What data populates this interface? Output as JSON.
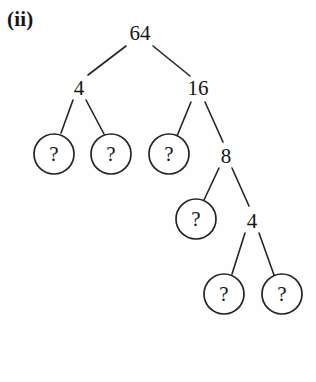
{
  "figure": {
    "label": "(ii)",
    "type": "factor-tree",
    "background_color": "#fefefe",
    "ink_color": "#242424",
    "text_color": "#161616"
  },
  "nodes": [
    {
      "id": "n-64",
      "label": "64",
      "kind": "value",
      "x": 140,
      "y": 33,
      "level": 0
    },
    {
      "id": "n-4a",
      "label": "4",
      "kind": "value",
      "x": 79,
      "y": 88,
      "level": 1
    },
    {
      "id": "n-16",
      "label": "16",
      "kind": "value",
      "x": 198,
      "y": 88,
      "level": 1
    },
    {
      "id": "q-1",
      "label": "?",
      "kind": "unknown",
      "x": 54,
      "y": 154,
      "r": 20,
      "level": 2
    },
    {
      "id": "q-2",
      "label": "?",
      "kind": "unknown",
      "x": 111,
      "y": 154,
      "r": 20,
      "level": 2
    },
    {
      "id": "q-3",
      "label": "?",
      "kind": "unknown",
      "x": 169,
      "y": 154,
      "r": 20,
      "level": 2
    },
    {
      "id": "n-8",
      "label": "8",
      "kind": "value",
      "x": 226,
      "y": 156,
      "level": 2
    },
    {
      "id": "q-4",
      "label": "?",
      "kind": "unknown",
      "x": 196,
      "y": 219,
      "r": 20,
      "level": 3
    },
    {
      "id": "n-4b",
      "label": "4",
      "kind": "value",
      "x": 252,
      "y": 221,
      "level": 3
    },
    {
      "id": "q-5",
      "label": "?",
      "kind": "unknown",
      "x": 224,
      "y": 294,
      "r": 20,
      "level": 4
    },
    {
      "id": "q-6",
      "label": "?",
      "kind": "unknown",
      "x": 282,
      "y": 294,
      "r": 20,
      "level": 4
    }
  ],
  "edges": [
    {
      "from": "n-64",
      "to": "n-4a",
      "x1": 126,
      "y1": 46,
      "x2": 88,
      "y2": 75
    },
    {
      "from": "n-64",
      "to": "n-16",
      "x1": 153,
      "y1": 46,
      "x2": 190,
      "y2": 76
    },
    {
      "from": "n-4a",
      "to": "q-1",
      "x1": 73,
      "y1": 100,
      "x2": 61,
      "y2": 133
    },
    {
      "from": "n-4a",
      "to": "q-2",
      "x1": 86,
      "y1": 100,
      "x2": 104,
      "y2": 134
    },
    {
      "from": "n-16",
      "to": "q-3",
      "x1": 191,
      "y1": 102,
      "x2": 177,
      "y2": 136
    },
    {
      "from": "n-16",
      "to": "n-8",
      "x1": 205,
      "y1": 102,
      "x2": 223,
      "y2": 142
    },
    {
      "from": "n-8",
      "to": "q-4",
      "x1": 219,
      "y1": 168,
      "x2": 204,
      "y2": 200
    },
    {
      "from": "n-8",
      "to": "n-4b",
      "x1": 232,
      "y1": 168,
      "x2": 249,
      "y2": 206
    },
    {
      "from": "n-4b",
      "to": "q-5",
      "x1": 245,
      "y1": 233,
      "x2": 232,
      "y2": 274
    },
    {
      "from": "n-4b",
      "to": "q-6",
      "x1": 259,
      "y1": 233,
      "x2": 274,
      "y2": 275
    }
  ]
}
